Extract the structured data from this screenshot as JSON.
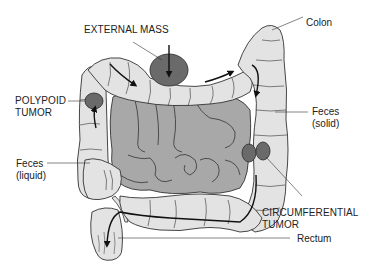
{
  "diagram": {
    "colors": {
      "colon_fill": "#e3e3e3",
      "small_intestine_fill": "#a8a8a8",
      "tumor_fill": "#6a6a6a",
      "outline": "#333333",
      "arrow": "#111111",
      "background": "#ffffff"
    },
    "labels": {
      "external_mass": "EXTERNAL MASS",
      "colon": "Colon",
      "polypoid_tumor_line1": "POLYPOID",
      "polypoid_tumor_line2": "TUMOR",
      "feces_solid_line1": "Feces",
      "feces_solid_line2": "(solid)",
      "feces_liquid_line1": "Feces",
      "feces_liquid_line2": "(liquid)",
      "circumferential_tumor_line1": "CIRCUMFERENTIAL",
      "circumferential_tumor_line2": "TUMOR",
      "rectum": "Rectum"
    },
    "structures": [
      {
        "name": "colon",
        "type": "large intestine"
      },
      {
        "name": "small-intestine",
        "type": "small intestine loops"
      },
      {
        "name": "external-mass",
        "type": "obstruction"
      },
      {
        "name": "polypoid-tumor",
        "type": "obstruction"
      },
      {
        "name": "circumferential-tumor",
        "type": "obstruction"
      },
      {
        "name": "rectum",
        "type": "terminal segment"
      },
      {
        "name": "appendix",
        "type": "appendage"
      }
    ]
  }
}
